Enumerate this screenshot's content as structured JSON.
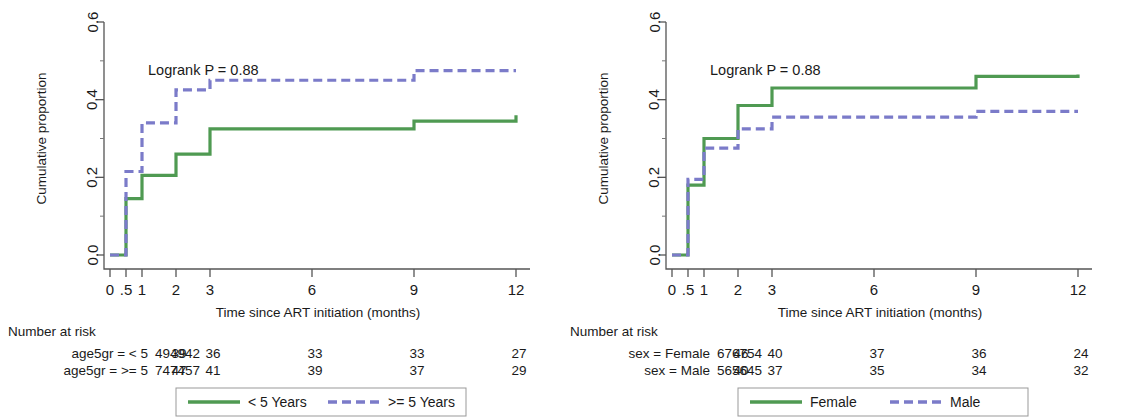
{
  "figure": {
    "type": "survival-curves",
    "panel_count": 2
  },
  "panels": [
    {
      "id": "left",
      "annotation": "Logrank P = 0.88",
      "xlabel": "Time since ART initiation (months)",
      "ylabel": "Cumulative proportion",
      "xticks": [
        "0",
        ".5",
        "1",
        "2",
        "3",
        "6",
        "9",
        "12"
      ],
      "yticks": [
        "0.0",
        "0.2",
        "0.4",
        "0.6"
      ],
      "risk_title": "Number at risk",
      "risk_rows": [
        {
          "label": "age5gr = < 5",
          "values": [
            "49",
            "49",
            "42",
            "39",
            "36",
            "33",
            "33",
            "27"
          ]
        },
        {
          "label": "age5gr = >= 5",
          "values": [
            "74",
            "74",
            "57",
            "47",
            "41",
            "39",
            "37",
            "29"
          ]
        }
      ],
      "legend": [
        {
          "label": "< 5 Years",
          "style": "solid",
          "color": "#4f9a52"
        },
        {
          "label": ">= 5 Years",
          "style": "dashed",
          "color": "#7b7bc9"
        }
      ]
    },
    {
      "id": "right",
      "annotation": "Logrank P = 0.88",
      "xlabel": "Time since ART initiation (months)",
      "ylabel": "Cumulative proportion",
      "xticks": [
        "0",
        ".5",
        "1",
        "2",
        "3",
        "6",
        "9",
        "12"
      ],
      "yticks": [
        "0.0",
        "0.2",
        "0.4",
        "0.6"
      ],
      "risk_title": "Number at risk",
      "risk_rows": [
        {
          "label": "sex = Female",
          "values": [
            "67",
            "67",
            "54",
            "46",
            "40",
            "37",
            "36",
            "24"
          ]
        },
        {
          "label": "sex = Male",
          "values": [
            "56",
            "56",
            "45",
            "40",
            "37",
            "35",
            "34",
            "32"
          ]
        }
      ],
      "legend": [
        {
          "label": "Female",
          "style": "solid",
          "color": "#4f9a52"
        },
        {
          "label": "Male",
          "style": "dashed",
          "color": "#7b7bc9"
        }
      ]
    }
  ],
  "chart_data": [
    {
      "type": "line",
      "panel": "left",
      "title": "",
      "annotation": "Logrank P = 0.88",
      "xlabel": "Time since ART initiation (months)",
      "ylabel": "Cumulative proportion",
      "xlim": [
        0,
        12
      ],
      "ylim": [
        0,
        0.6
      ],
      "xtick_values": [
        0,
        0.5,
        1,
        2,
        3,
        6,
        9,
        12
      ],
      "xtick_labels": [
        "0",
        ".5",
        "1",
        "2",
        "3",
        "6",
        "9",
        "12"
      ],
      "ytick_values": [
        0.0,
        0.2,
        0.4,
        0.6
      ],
      "ytick_labels": [
        "0.0",
        "0.2",
        "0.4",
        "0.6"
      ],
      "grid": false,
      "legend_position": "bottom",
      "step": "post",
      "series": [
        {
          "name": "< 5 Years",
          "style": "solid",
          "color": "#4f9a52",
          "x": [
            0,
            0.5,
            1,
            2,
            3,
            9,
            12
          ],
          "y": [
            0.0,
            0.145,
            0.205,
            0.26,
            0.325,
            0.345,
            0.36
          ]
        },
        {
          "name": ">= 5 Years",
          "style": "dashed",
          "color": "#7b7bc9",
          "x": [
            0,
            0.5,
            1,
            2,
            3,
            9,
            12
          ],
          "y": [
            0.0,
            0.215,
            0.34,
            0.425,
            0.45,
            0.475,
            0.475
          ]
        }
      ]
    },
    {
      "type": "line",
      "panel": "right",
      "title": "",
      "annotation": "Logrank P = 0.88",
      "xlabel": "Time since ART initiation (months)",
      "ylabel": "Cumulative proportion",
      "xlim": [
        0,
        12
      ],
      "ylim": [
        0,
        0.6
      ],
      "xtick_values": [
        0,
        0.5,
        1,
        2,
        3,
        6,
        9,
        12
      ],
      "xtick_labels": [
        "0",
        ".5",
        "1",
        "2",
        "3",
        "6",
        "9",
        "12"
      ],
      "ytick_values": [
        0.0,
        0.2,
        0.4,
        0.6
      ],
      "ytick_labels": [
        "0.0",
        "0.2",
        "0.4",
        "0.6"
      ],
      "grid": false,
      "legend_position": "bottom",
      "step": "post",
      "series": [
        {
          "name": "Female",
          "style": "solid",
          "color": "#4f9a52",
          "x": [
            0,
            0.5,
            1,
            2,
            3,
            9,
            12
          ],
          "y": [
            0.0,
            0.18,
            0.3,
            0.385,
            0.43,
            0.46,
            0.465
          ]
        },
        {
          "name": "Male",
          "style": "dashed",
          "color": "#7b7bc9",
          "x": [
            0,
            0.5,
            1,
            2,
            3,
            9,
            12
          ],
          "y": [
            0.0,
            0.195,
            0.275,
            0.325,
            0.355,
            0.37,
            0.37
          ]
        }
      ]
    }
  ],
  "risk_table_x_positions": [
    0,
    0.5,
    1,
    2,
    3,
    6,
    9,
    12
  ]
}
